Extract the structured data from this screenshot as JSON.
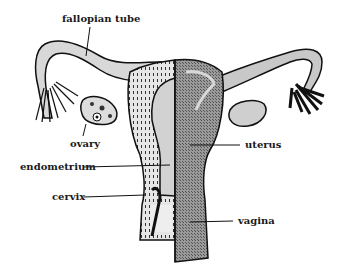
{
  "labels": {
    "fallopian_tube": "fallopian tube",
    "ovary": "ovary",
    "endometrium": "endometrium",
    "cervix": "cervix",
    "uterus": "uterus",
    "vagina": "vagina"
  },
  "colors": {
    "outline": "#111111",
    "dark_fill": "#8a8a8a",
    "light_fill": "#c8c8c8",
    "background": "#ffffff"
  }
}
